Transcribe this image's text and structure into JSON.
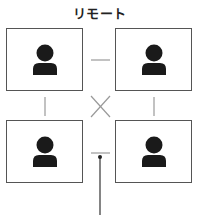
{
  "title": "リモート",
  "colors": {
    "border": "#555555",
    "connector": "#999999",
    "icon": "#1a1a1a",
    "arrow": "#333333"
  },
  "participants": [
    {
      "id": "top-left",
      "icon": "person-icon"
    },
    {
      "id": "top-right",
      "icon": "person-icon"
    },
    {
      "id": "bottom-left",
      "icon": "person-icon"
    },
    {
      "id": "bottom-right",
      "icon": "person-icon"
    }
  ]
}
